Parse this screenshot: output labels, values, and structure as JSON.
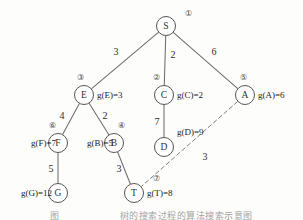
{
  "figure": {
    "caption": "图　　　　　　  树的搜索过程的算法搜索示意图"
  },
  "graph": {
    "nodes": [
      {
        "id": "S",
        "label": "S",
        "order": "①",
        "cx": 166,
        "cy": 26,
        "r": 9.5,
        "order_dx": 22,
        "order_dy": -10,
        "g_text": "",
        "g_dx": 0,
        "g_dy": 0
      },
      {
        "id": "E",
        "label": "E",
        "order": "③",
        "cx": 84,
        "cy": 95,
        "r": 9.5,
        "order_dx": -4,
        "order_dy": -15,
        "g_text": "g(E)=3",
        "g_dx": 13,
        "g_dy": 3
      },
      {
        "id": "C",
        "label": "C",
        "order": "②",
        "cx": 164,
        "cy": 95,
        "r": 9.5,
        "order_dx": -8,
        "order_dy": -15,
        "g_text": "g(C)=2",
        "g_dx": 13,
        "g_dy": 3
      },
      {
        "id": "A",
        "label": "A",
        "order": "⑤",
        "cx": 245,
        "cy": 95,
        "r": 9.5,
        "order_dx": -2,
        "order_dy": -15,
        "g_text": "g(A)=6",
        "g_dx": 13,
        "g_dy": 3
      },
      {
        "id": "F",
        "label": "F",
        "order": "⑥",
        "cx": 58,
        "cy": 143,
        "r": 9.5,
        "order_dx": -6,
        "order_dy": -15,
        "g_text": "g(F)=7",
        "g_dx": -48,
        "g_dy": 3
      },
      {
        "id": "B",
        "label": "B",
        "order": "④",
        "cx": 114,
        "cy": 143,
        "r": 9.5,
        "order_dx": 7,
        "order_dy": -15,
        "g_text": "g(B)=5",
        "g_dx": -47,
        "g_dy": 3
      },
      {
        "id": "D",
        "label": "D",
        "order": "",
        "cx": 164,
        "cy": 147,
        "r": 9.5,
        "order_dx": 0,
        "order_dy": 0,
        "g_text": "g(D)=9",
        "g_dx": 13,
        "g_dy": -12
      },
      {
        "id": "G",
        "label": "G",
        "order": "",
        "cx": 58,
        "cy": 193,
        "r": 9.5,
        "order_dx": 0,
        "order_dy": 0,
        "g_text": "g(G)=12",
        "g_dx": -52,
        "g_dy": 3
      },
      {
        "id": "T",
        "label": "T",
        "order": "⑦",
        "cx": 134,
        "cy": 193,
        "r": 9.5,
        "order_dx": 22,
        "order_dy": -12,
        "g_text": "g(T)=8",
        "g_dx": 13,
        "g_dy": 3
      }
    ],
    "edges": [
      {
        "from": "S",
        "to": "E",
        "weight": "3",
        "style": "solid",
        "label_x": 116,
        "label_y": 55
      },
      {
        "from": "S",
        "to": "C",
        "weight": "2",
        "style": "solid",
        "label_x": 173,
        "label_y": 58
      },
      {
        "from": "S",
        "to": "A",
        "weight": "6",
        "style": "solid",
        "label_x": 214,
        "label_y": 55
      },
      {
        "from": "E",
        "to": "F",
        "weight": "4",
        "style": "solid",
        "label_x": 62,
        "label_y": 119
      },
      {
        "from": "E",
        "to": "B",
        "weight": "2",
        "style": "solid",
        "label_x": 105,
        "label_y": 119
      },
      {
        "from": "C",
        "to": "D",
        "weight": "7",
        "style": "solid",
        "label_x": 157,
        "label_y": 125
      },
      {
        "from": "F",
        "to": "G",
        "weight": "5",
        "style": "solid",
        "label_x": 51,
        "label_y": 172
      },
      {
        "from": "B",
        "to": "T",
        "weight": "3",
        "style": "solid",
        "label_x": 119,
        "label_y": 172
      },
      {
        "from": "A",
        "to": "T",
        "weight": "3",
        "style": "dashed",
        "label_x": 205,
        "label_y": 160
      }
    ]
  },
  "style": {
    "line_color": "#6e6e6e",
    "node_stroke": "#555555",
    "node_fill": "#ffffff",
    "text_color": "#2b2b2b",
    "background": "#fdfdfc"
  }
}
